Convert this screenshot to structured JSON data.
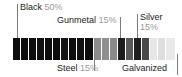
{
  "chart_data": {
    "type": "bar",
    "orientation": "horizontal-stacked",
    "title": "",
    "xlabel": "",
    "ylabel": "",
    "grid": false,
    "legend_position": "callout-labels",
    "categories": [
      "Black",
      "Steel",
      "Gunmetal",
      "Galvanized",
      "Silver"
    ],
    "values": [
      50,
      15,
      15,
      5,
      15
    ],
    "value_unit": "%",
    "segment_colors": [
      "#0f0f0f",
      "#8a8a8a",
      "#232323",
      "#3d3d3d",
      "#e2e2e2"
    ],
    "segment_count": 20,
    "segments": [
      {
        "category": "Black",
        "color": "#0d0d0d",
        "width_px": 8
      },
      {
        "category": "Black",
        "color": "#0d0d0d",
        "width_px": 8
      },
      {
        "category": "Black",
        "color": "#0d0d0d",
        "width_px": 8
      },
      {
        "category": "Black",
        "color": "#101010",
        "width_px": 8
      },
      {
        "category": "Black",
        "color": "#0d0d0d",
        "width_px": 8
      },
      {
        "category": "Black",
        "color": "#0d0d0d",
        "width_px": 8
      },
      {
        "category": "Black",
        "color": "#141414",
        "width_px": 8
      },
      {
        "category": "Black",
        "color": "#0d0d0d",
        "width_px": 8
      },
      {
        "category": "Black",
        "color": "#101010",
        "width_px": 8
      },
      {
        "category": "Black",
        "color": "#0d0d0d",
        "width_px": 9
      },
      {
        "category": "Steel",
        "color": "#8c8c8c",
        "width_px": 8
      },
      {
        "category": "Steel",
        "color": "#8f8f8f",
        "width_px": 8
      },
      {
        "category": "Steel",
        "color": "#8a8a8a",
        "width_px": 8
      },
      {
        "category": "Gunmetal",
        "color": "#1c1c1c",
        "width_px": 8
      },
      {
        "category": "Gunmetal",
        "color": "#595959",
        "width_px": 8
      },
      {
        "category": "Gunmetal",
        "color": "#1f1f1f",
        "width_px": 8
      },
      {
        "category": "Galvanized",
        "color": "#4a4a4a",
        "width_px": 8
      },
      {
        "category": "Silver",
        "color": "#e6e6e6",
        "width_px": 8
      },
      {
        "category": "Silver",
        "color": "#dedede",
        "width_px": 8
      },
      {
        "category": "Silver",
        "color": "#e9e9e9",
        "width_px": 9
      }
    ],
    "annotations": [
      {
        "name": "Black",
        "percent": "50%",
        "position": "above-left"
      },
      {
        "name": "Gunmetal",
        "percent": "15%",
        "position": "above-center"
      },
      {
        "name": "Silver",
        "percent": "15%",
        "position": "above-right"
      },
      {
        "name": "Steel",
        "percent": "15%",
        "position": "below-center"
      },
      {
        "name": "Galvanized",
        "percent": "",
        "position": "below-right"
      }
    ]
  },
  "labels": {
    "black": {
      "name": "Black",
      "percent": "50%"
    },
    "gunmetal": {
      "name": "Gunmetal",
      "percent": "15%"
    },
    "silver": {
      "name": "Silver",
      "percent": "15%"
    },
    "steel": {
      "name": "Steel",
      "percent": "15%"
    },
    "galvanized": {
      "name": "Galvanized",
      "percent": ""
    }
  },
  "colors": {
    "label_text": "#1a1a1a",
    "percent_text": "#9a9a9a",
    "leader_line": "#7d7d7d",
    "background": "#ffffff"
  }
}
